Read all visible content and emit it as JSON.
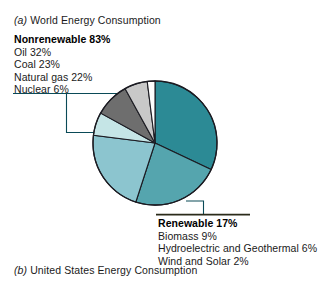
{
  "figure": {
    "caption_a_prefix": "(a)",
    "caption_a": " World Energy Consumption",
    "caption_b_prefix": "(b)",
    "caption_b": " United States Energy Consumption"
  },
  "legends": {
    "nonrenewable": {
      "title": "Nonrenewable 83%",
      "items": [
        "Oil 32%",
        "Coal 23%",
        "Natural gas 22%",
        "Nuclear 6%"
      ]
    },
    "renewable": {
      "title": "Renewable 17%",
      "items": [
        "Biomass 9%",
        "Hydroelectric and Geothermal 6%",
        "Wind and Solar 2%"
      ]
    }
  },
  "colors": {
    "oil": "#2c8a95",
    "coal": "#55a5ae",
    "natural_gas": "#8cc5cf",
    "nuclear": "#c5e5e6",
    "biomass": "#6e6e6e",
    "hydro_geothermal": "#c8c8c8",
    "wind_solar": "#fdfdfd",
    "outline": "#1b1b22",
    "leader_line": "#0a4a57",
    "rule": "#2b2b1a"
  },
  "chart_data": {
    "type": "pie",
    "title": "(a) World Energy Consumption",
    "labels": [
      "Oil",
      "Coal",
      "Natural gas",
      "Nuclear",
      "Biomass",
      "Hydroelectric and Geothermal",
      "Wind and Solar"
    ],
    "values": [
      32,
      23,
      22,
      6,
      9,
      6,
      2
    ],
    "units": "percent",
    "groups": [
      {
        "name": "Nonrenewable",
        "total": 83,
        "members": [
          "Oil",
          "Coal",
          "Natural gas",
          "Nuclear"
        ]
      },
      {
        "name": "Renewable",
        "total": 17,
        "members": [
          "Biomass",
          "Hydroelectric and Geothermal",
          "Wind and Solar"
        ]
      }
    ],
    "slice_colors": [
      "#2c8a95",
      "#55a5ae",
      "#8cc5cf",
      "#c5e5e6",
      "#6e6e6e",
      "#c8c8c8",
      "#fdfdfd"
    ],
    "start_angle_deg": 0,
    "direction": "clockwise",
    "legend": "callout-labels",
    "grid": false
  },
  "geometry": {
    "cx": 155,
    "cy": 143,
    "r": 62
  }
}
